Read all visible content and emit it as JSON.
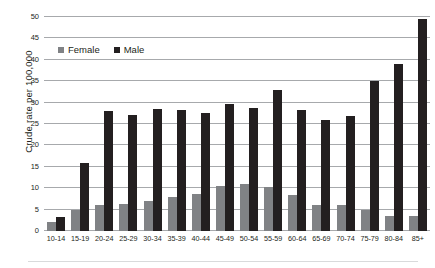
{
  "chart_data": {
    "type": "bar",
    "title": "",
    "xlabel": "",
    "ylabel": "Crude rate per 100,000",
    "ylim": [
      0,
      50
    ],
    "yticks": [
      0,
      5,
      10,
      15,
      20,
      25,
      30,
      35,
      40,
      45,
      50
    ],
    "grid": true,
    "legend_position": "top-left",
    "categories": [
      "10-14",
      "15-19",
      "20-24",
      "25-29",
      "30-34",
      "35-39",
      "40-44",
      "45-49",
      "50-54",
      "55-59",
      "60-64",
      "65-69",
      "70-74",
      "75-79",
      "80-84",
      "85+"
    ],
    "series": [
      {
        "name": "Female",
        "color": "#808285",
        "values": [
          2.0,
          5.0,
          6.0,
          6.3,
          7.0,
          8.0,
          8.7,
          10.5,
          11.0,
          10.3,
          8.5,
          6.0,
          6.0,
          5.0,
          3.5,
          3.5
        ]
      },
      {
        "name": "Male",
        "color": "#231f20",
        "values": [
          3.2,
          15.8,
          28.0,
          27.2,
          28.6,
          28.2,
          27.5,
          29.6,
          28.7,
          33.0,
          28.3,
          26.0,
          26.8,
          35.0,
          39.0,
          49.5
        ]
      }
    ]
  },
  "legend": {
    "items": [
      {
        "label": "Female",
        "color": "#808285"
      },
      {
        "label": "Male",
        "color": "#231f20"
      }
    ]
  },
  "axis": {
    "y_title": "Crude rate per 100,000"
  }
}
